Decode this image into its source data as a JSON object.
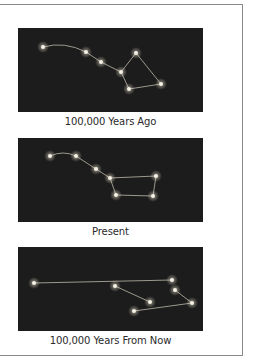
{
  "colors": {
    "sky": "#1c1c1c",
    "star": "#f4f0e6",
    "glow": "#fff6dd",
    "line": "#bdb7aa",
    "caption": "#2a2a2a",
    "frame_border": "#8a8a8a"
  },
  "figure": {
    "panels": [
      {
        "caption": "100,000 Years Ago",
        "stars": [
          [
            25,
            19
          ],
          [
            68,
            24
          ],
          [
            83,
            34
          ],
          [
            103,
            44
          ],
          [
            118,
            25
          ],
          [
            111,
            61
          ],
          [
            143,
            56
          ]
        ],
        "lines": [
          [
            0,
            1,
            "curve"
          ],
          [
            1,
            2
          ],
          [
            2,
            3
          ],
          [
            3,
            4
          ],
          [
            3,
            5
          ],
          [
            5,
            6
          ],
          [
            6,
            4
          ]
        ]
      },
      {
        "caption": "Present",
        "stars": [
          [
            32,
            18
          ],
          [
            58,
            18
          ],
          [
            78,
            31
          ],
          [
            92,
            40
          ],
          [
            138,
            38
          ],
          [
            98,
            57
          ],
          [
            135,
            58
          ]
        ],
        "lines": [
          [
            0,
            1,
            "curve"
          ],
          [
            1,
            2
          ],
          [
            2,
            3
          ],
          [
            3,
            4
          ],
          [
            3,
            5
          ],
          [
            5,
            6
          ],
          [
            6,
            4
          ]
        ]
      },
      {
        "caption": "100,000 Years From Now",
        "stars": [
          [
            16,
            36
          ],
          [
            97,
            39
          ],
          [
            154,
            33
          ],
          [
            157,
            43
          ],
          [
            132,
            55
          ],
          [
            116,
            64
          ],
          [
            174,
            56
          ]
        ],
        "lines": [
          [
            0,
            2
          ],
          [
            1,
            4
          ],
          [
            5,
            6
          ],
          [
            3,
            6
          ]
        ]
      }
    ]
  }
}
